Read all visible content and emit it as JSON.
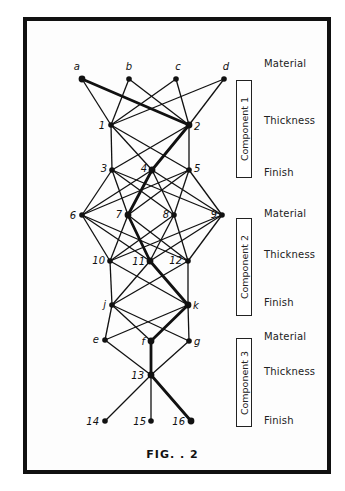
{
  "figure": {
    "caption": "FIG. . 2"
  },
  "nodes": [
    {
      "id": "a",
      "label": "a",
      "x": 82,
      "y": 79,
      "lx": -2,
      "ly": -9,
      "anchor": "end"
    },
    {
      "id": "b",
      "label": "b",
      "x": 129,
      "y": 79,
      "lx": 0,
      "ly": -9,
      "anchor": "middle"
    },
    {
      "id": "c",
      "label": "c",
      "x": 176,
      "y": 79,
      "lx": 2,
      "ly": -9,
      "anchor": "middle"
    },
    {
      "id": "d",
      "label": "d",
      "x": 224,
      "y": 79,
      "lx": 2,
      "ly": -9,
      "anchor": "middle"
    },
    {
      "id": "1",
      "label": "1",
      "x": 111,
      "y": 125,
      "lx": -6,
      "ly": 4,
      "anchor": "end"
    },
    {
      "id": "2",
      "label": "2",
      "x": 189,
      "y": 125,
      "lx": 5,
      "ly": 5,
      "anchor": "start"
    },
    {
      "id": "3",
      "label": "3",
      "x": 112,
      "y": 170,
      "lx": -5,
      "ly": 2,
      "anchor": "end"
    },
    {
      "id": "4",
      "label": "4",
      "x": 152,
      "y": 170,
      "lx": -5,
      "ly": 2,
      "anchor": "end"
    },
    {
      "id": "5",
      "label": "5",
      "x": 189,
      "y": 170,
      "lx": 5,
      "ly": 2,
      "anchor": "start"
    },
    {
      "id": "6",
      "label": "6",
      "x": 82,
      "y": 215,
      "lx": -6,
      "ly": 4,
      "anchor": "end"
    },
    {
      "id": "7",
      "label": "7",
      "x": 128,
      "y": 215,
      "lx": -6,
      "ly": 3,
      "anchor": "end"
    },
    {
      "id": "8",
      "label": "8",
      "x": 174,
      "y": 215,
      "lx": -5,
      "ly": 3,
      "anchor": "end"
    },
    {
      "id": "9",
      "label": "9",
      "x": 222,
      "y": 215,
      "lx": -5,
      "ly": 3,
      "anchor": "end"
    },
    {
      "id": "10",
      "label": "10",
      "x": 110,
      "y": 261,
      "lx": -5,
      "ly": 3,
      "anchor": "end"
    },
    {
      "id": "11",
      "label": "11",
      "x": 150,
      "y": 261,
      "lx": -5,
      "ly": 4,
      "anchor": "end"
    },
    {
      "id": "12",
      "label": "12",
      "x": 188,
      "y": 261,
      "lx": -6,
      "ly": 3,
      "anchor": "end"
    },
    {
      "id": "j",
      "label": "j",
      "x": 112,
      "y": 305,
      "lx": -6,
      "ly": 3,
      "anchor": "end"
    },
    {
      "id": "k",
      "label": "k",
      "x": 188,
      "y": 305,
      "lx": 5,
      "ly": 4,
      "anchor": "start"
    },
    {
      "id": "e",
      "label": "e",
      "x": 105,
      "y": 340,
      "lx": -6,
      "ly": 3,
      "anchor": "end"
    },
    {
      "id": "f",
      "label": "f",
      "x": 151,
      "y": 341,
      "lx": -6,
      "ly": 4,
      "anchor": "end"
    },
    {
      "id": "g",
      "label": "g",
      "x": 189,
      "y": 341,
      "lx": 5,
      "ly": 4,
      "anchor": "start"
    },
    {
      "id": "13",
      "label": "13",
      "x": 151,
      "y": 375,
      "lx": -7,
      "ly": 4,
      "anchor": "end"
    },
    {
      "id": "14",
      "label": "14",
      "x": 105,
      "y": 421,
      "lx": -6,
      "ly": 4,
      "anchor": "end"
    },
    {
      "id": "15",
      "label": "15",
      "x": 151,
      "y": 421,
      "lx": -5,
      "ly": 4,
      "anchor": "end"
    },
    {
      "id": "16",
      "label": "16",
      "x": 191,
      "y": 421,
      "lx": -6,
      "ly": 4,
      "anchor": "end"
    }
  ],
  "edges": [
    [
      "a",
      "1"
    ],
    [
      "a",
      "2"
    ],
    [
      "b",
      "1"
    ],
    [
      "b",
      "2"
    ],
    [
      "c",
      "1"
    ],
    [
      "c",
      "2"
    ],
    [
      "d",
      "1"
    ],
    [
      "d",
      "2"
    ],
    [
      "1",
      "3"
    ],
    [
      "1",
      "4"
    ],
    [
      "1",
      "5"
    ],
    [
      "2",
      "3"
    ],
    [
      "2",
      "4"
    ],
    [
      "2",
      "5"
    ],
    [
      "3",
      "6"
    ],
    [
      "3",
      "7"
    ],
    [
      "3",
      "8"
    ],
    [
      "3",
      "9"
    ],
    [
      "4",
      "6"
    ],
    [
      "4",
      "7"
    ],
    [
      "4",
      "8"
    ],
    [
      "4",
      "9"
    ],
    [
      "5",
      "6"
    ],
    [
      "5",
      "7"
    ],
    [
      "5",
      "8"
    ],
    [
      "5",
      "9"
    ],
    [
      "6",
      "10"
    ],
    [
      "6",
      "11"
    ],
    [
      "6",
      "12"
    ],
    [
      "7",
      "10"
    ],
    [
      "7",
      "11"
    ],
    [
      "7",
      "12"
    ],
    [
      "8",
      "10"
    ],
    [
      "8",
      "11"
    ],
    [
      "8",
      "12"
    ],
    [
      "9",
      "10"
    ],
    [
      "9",
      "11"
    ],
    [
      "9",
      "12"
    ],
    [
      "10",
      "j"
    ],
    [
      "10",
      "k"
    ],
    [
      "11",
      "j"
    ],
    [
      "11",
      "k"
    ],
    [
      "12",
      "j"
    ],
    [
      "12",
      "k"
    ],
    [
      "j",
      "e"
    ],
    [
      "j",
      "f"
    ],
    [
      "j",
      "g"
    ],
    [
      "k",
      "e"
    ],
    [
      "k",
      "f"
    ],
    [
      "k",
      "g"
    ],
    [
      "e",
      "13"
    ],
    [
      "f",
      "13"
    ],
    [
      "g",
      "13"
    ],
    [
      "13",
      "14"
    ],
    [
      "13",
      "15"
    ],
    [
      "13",
      "16"
    ]
  ],
  "highlighted_path": [
    "a",
    "2",
    "4",
    "7",
    "11",
    "k",
    "f",
    "13",
    "16"
  ],
  "components": [
    {
      "label": "Component 1",
      "rows": [
        "Material",
        "Thickness",
        "Finish"
      ],
      "box_top": 80,
      "box_height": 96,
      "row_y": [
        64,
        121,
        173
      ]
    },
    {
      "label": "Component 2",
      "rows": [
        "Material",
        "Thickness",
        "Finish"
      ],
      "box_top": 218,
      "box_height": 96,
      "row_y": [
        214,
        255,
        303
      ]
    },
    {
      "label": "Component 3",
      "rows": [
        "Material",
        "Thickness",
        "Finish"
      ],
      "box_top": 338,
      "box_height": 87,
      "row_y": [
        337,
        372,
        421
      ]
    }
  ],
  "colors": {
    "ink": "#111111",
    "paper": "#fdfdfd"
  }
}
